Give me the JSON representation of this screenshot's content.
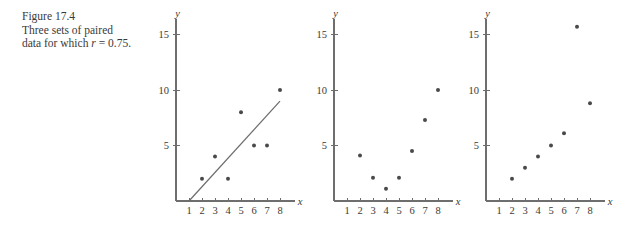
{
  "caption": {
    "line1": "Figure 17.4",
    "line2": "Three sets of paired",
    "line3_pre": "data for which ",
    "line3_sym": "r",
    "line3_post": " = 0.75."
  },
  "axis_labels": {
    "x": "x",
    "y": "y"
  },
  "chart_data": [
    {
      "type": "scatter",
      "title": "",
      "xlabel": "x",
      "ylabel": "y",
      "xlim": [
        0,
        9
      ],
      "ylim": [
        0,
        16
      ],
      "xticks": [
        1,
        2,
        3,
        4,
        5,
        6,
        7,
        8
      ],
      "yticks": [
        5,
        10,
        15
      ],
      "grid": false,
      "legend": "none",
      "x": [
        2,
        3,
        4,
        5,
        6,
        7,
        8
      ],
      "y": [
        2,
        4,
        2,
        8,
        5,
        5,
        10
      ],
      "trendline": {
        "visible": true,
        "x0": 1,
        "y0": 0,
        "x1": 8,
        "y1": 9
      },
      "annotation": "Linear relationship with scatter, r = 0.75"
    },
    {
      "type": "scatter",
      "title": "",
      "xlabel": "x",
      "ylabel": "y",
      "xlim": [
        0,
        9
      ],
      "ylim": [
        0,
        16
      ],
      "xticks": [
        1,
        2,
        3,
        4,
        5,
        6,
        7,
        8
      ],
      "yticks": [
        5,
        10,
        15
      ],
      "grid": false,
      "legend": "none",
      "x": [
        2,
        3,
        4,
        5,
        6,
        7,
        8
      ],
      "y": [
        4.1,
        2.1,
        1.1,
        2.1,
        4.5,
        7.3,
        10
      ],
      "trendline": {
        "visible": false
      },
      "annotation": "Curvilinear relationship, r = 0.75"
    },
    {
      "type": "scatter",
      "title": "",
      "xlabel": "x",
      "ylabel": "y",
      "xlim": [
        0,
        9
      ],
      "ylim": [
        0,
        16
      ],
      "xticks": [
        1,
        2,
        3,
        4,
        5,
        6,
        7,
        8
      ],
      "yticks": [
        5,
        10,
        15
      ],
      "grid": false,
      "legend": "none",
      "x": [
        2,
        3,
        4,
        5,
        6,
        7,
        8
      ],
      "y": [
        2,
        3,
        4,
        5,
        6.1,
        15.7,
        8.8
      ],
      "trendline": {
        "visible": false
      },
      "annotation": "Linear relationship with one outlier, r = 0.75"
    }
  ],
  "colors": {
    "dot": "#4a4a4a",
    "axis": "#6e6e6e",
    "line": "#6b6b6b",
    "text": "#3a3a3a",
    "background": "#ffffff"
  }
}
